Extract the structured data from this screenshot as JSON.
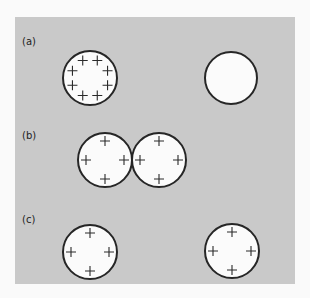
{
  "figure": {
    "background": "#c9c9c9",
    "panels": [
      {
        "label": "(a)",
        "label_pos": [
          22,
          36
        ],
        "spheres": [
          {
            "cx": 90,
            "cy": 78,
            "r": 27,
            "charges": 8,
            "charge_ring_r": 19
          },
          {
            "cx": 231,
            "cy": 78,
            "r": 26,
            "charges": 0,
            "charge_ring_r": 0
          }
        ]
      },
      {
        "label": "(b)",
        "label_pos": [
          22,
          130
        ],
        "spheres": [
          {
            "cx": 105,
            "cy": 160,
            "r": 27,
            "charges": 4,
            "charge_ring_r": 19
          },
          {
            "cx": 159,
            "cy": 160,
            "r": 27,
            "charges": 4,
            "charge_ring_r": 19
          }
        ]
      },
      {
        "label": "(c)",
        "label_pos": [
          22,
          214
        ],
        "spheres": [
          {
            "cx": 90,
            "cy": 252,
            "r": 27,
            "charges": 4,
            "charge_ring_r": 19
          },
          {
            "cx": 232,
            "cy": 251,
            "r": 27,
            "charges": 4,
            "charge_ring_r": 19
          }
        ]
      }
    ]
  }
}
